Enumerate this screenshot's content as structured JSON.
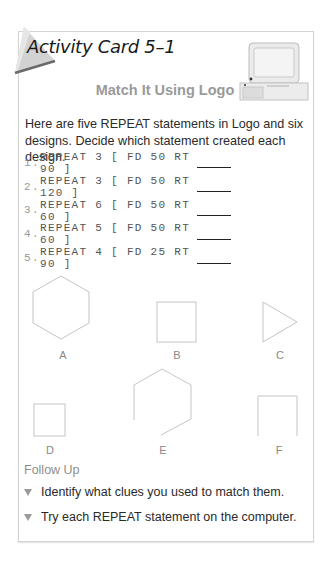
{
  "card": {
    "title": "Activity Card 5–1",
    "heading": "Match It Using Logo",
    "intro": "Here are five REPEAT statements in Logo and six designs. Decide which statement created each design.",
    "statements": [
      {
        "num": "1.",
        "code": "REPEAT 3 [ FD 50 RT 90 ]"
      },
      {
        "num": "2.",
        "code": "REPEAT 3 [ FD 50 RT 120 ]"
      },
      {
        "num": "3.",
        "code": "REPEAT 6 [ FD 50 RT 60 ]"
      },
      {
        "num": "4.",
        "code": "REPEAT 5 [ FD 50 RT 60 ]"
      },
      {
        "num": "5.",
        "code": "REPEAT 4 [ FD 25 RT 90 ]"
      }
    ],
    "designs": [
      {
        "label": "A",
        "shape": "hexagon"
      },
      {
        "label": "B",
        "shape": "square"
      },
      {
        "label": "C",
        "shape": "triangle"
      },
      {
        "label": "D",
        "shape": "small-square"
      },
      {
        "label": "E",
        "shape": "open-hexagon"
      },
      {
        "label": "F",
        "shape": "open-square"
      }
    ],
    "follow_up": {
      "title": "Follow Up",
      "items": [
        "Identify what clues you used to match them.",
        "Try each REPEAT statement on the computer."
      ]
    },
    "colors": {
      "border": "#d4d4d4",
      "heading": "#9a9a9a",
      "shape_stroke": "#c4c4c4",
      "tab_gray": "#c8c8c8"
    }
  }
}
